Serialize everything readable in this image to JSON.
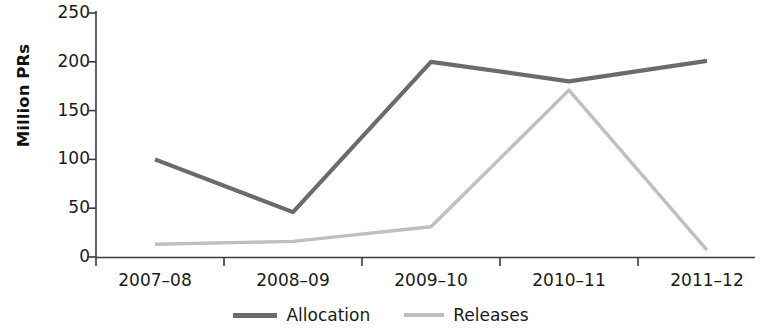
{
  "chart_data": {
    "type": "line",
    "title": "",
    "xlabel": "",
    "ylabel": "Million PRs",
    "categories": [
      "2007–08",
      "2008–09",
      "2009–10",
      "2010–11",
      "2011–12"
    ],
    "series": [
      {
        "name": "Allocation",
        "color": "#6b6b6b",
        "values": [
          100,
          46,
          200,
          180,
          201
        ]
      },
      {
        "name": "Releases",
        "color": "#bfbfbf",
        "values": [
          13,
          16,
          31,
          171,
          7
        ]
      }
    ],
    "ylim": [
      0,
      250
    ],
    "yticks": [
      0,
      50,
      100,
      150,
      200,
      250
    ],
    "ytick_labels": [
      "0",
      "50",
      "100",
      "150",
      "200",
      "250"
    ],
    "grid": false,
    "legend_position": "bottom"
  },
  "axes": {
    "y_title": "Million PRs"
  },
  "legend": {
    "items": [
      {
        "label": "Allocation"
      },
      {
        "label": "Releases"
      }
    ]
  }
}
